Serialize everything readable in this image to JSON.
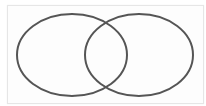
{
  "diagram": {
    "type": "venn",
    "sets": [
      {
        "id": "left",
        "label": "",
        "cx": 72,
        "cy": 55,
        "rx": 55,
        "ry": 41
      },
      {
        "id": "right",
        "label": "",
        "cx": 139,
        "cy": 55,
        "rx": 54,
        "ry": 41
      }
    ],
    "stroke_color": "#555555",
    "background_color": "#ffffff",
    "border_color": "#e6e6e6"
  }
}
